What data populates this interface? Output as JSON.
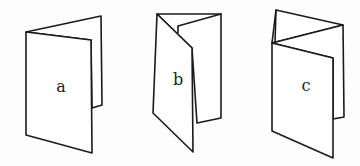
{
  "figure": {
    "stroke_color": "#1a1a1a",
    "background": "#fdfdfd",
    "items": [
      {
        "id": "a",
        "label": "a",
        "fold_type": "single fold (bifold)",
        "panels": 2
      },
      {
        "id": "b",
        "label": "b",
        "fold_type": "gate/roll fold (trifold, inward)",
        "panels": 3
      },
      {
        "id": "c",
        "label": "c",
        "fold_type": "accordion / zig-zag fold",
        "panels": 3
      }
    ]
  }
}
